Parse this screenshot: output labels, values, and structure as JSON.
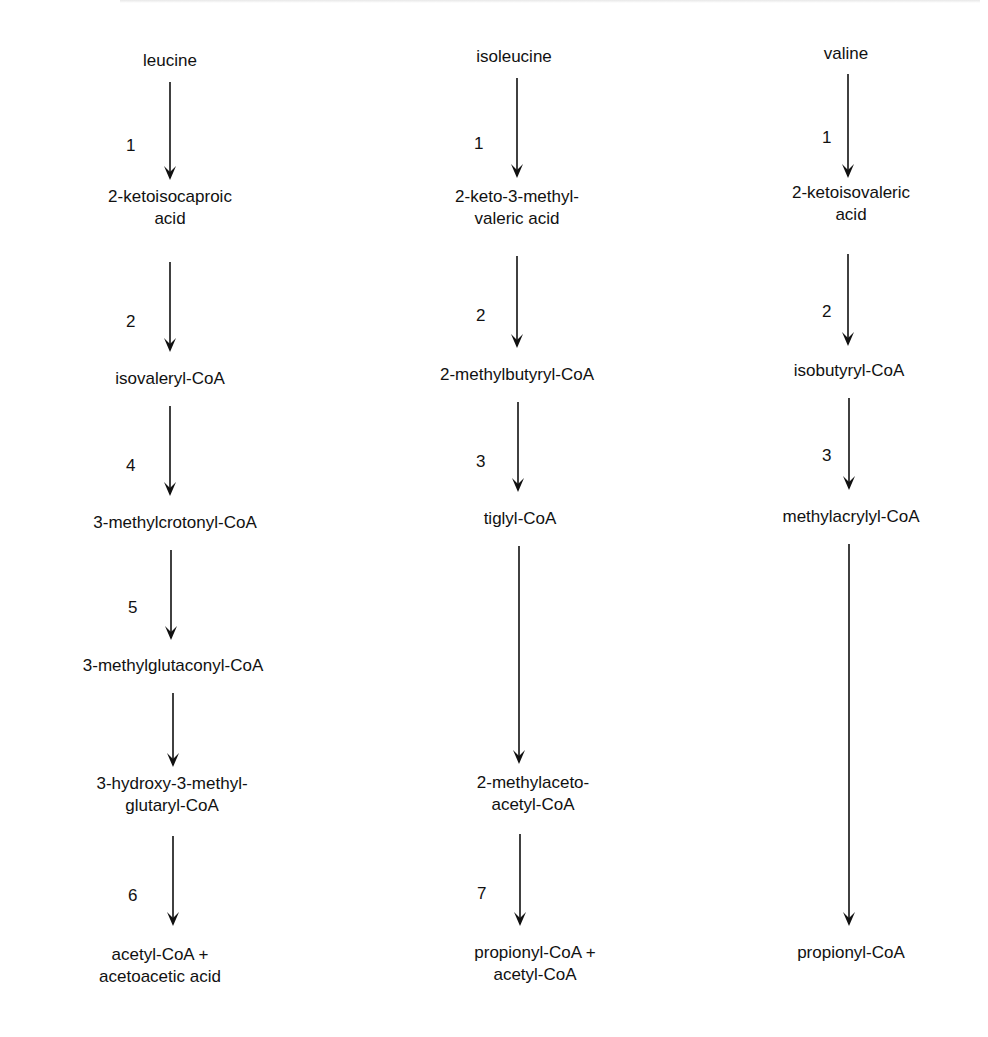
{
  "figure": {
    "type": "metabolic pathway diagram",
    "columns": [
      {
        "name": "leucine",
        "nodes": [
          {
            "lines": [
              "leucine"
            ]
          },
          {
            "lines": [
              "2-ketoisocaproic",
              "acid"
            ]
          },
          {
            "lines": [
              "isovaleryl-CoA"
            ]
          },
          {
            "lines": [
              "3-methylcrotonyl-CoA"
            ]
          },
          {
            "lines": [
              "3-methylglutaconyl-CoA"
            ]
          },
          {
            "lines": [
              "3-hydroxy-3-methyl-",
              "glutaryl-CoA"
            ]
          },
          {
            "lines": [
              "acetyl-CoA +",
              "acetoacetic acid"
            ]
          }
        ],
        "steps": [
          "1",
          "2",
          "4",
          "5",
          "",
          "6"
        ]
      },
      {
        "name": "isoleucine",
        "nodes": [
          {
            "lines": [
              "isoleucine"
            ]
          },
          {
            "lines": [
              "2-keto-3-methyl-",
              "valeric acid"
            ]
          },
          {
            "lines": [
              "2-methylbutyryl-CoA"
            ]
          },
          {
            "lines": [
              "tiglyl-CoA"
            ]
          },
          {
            "lines": [
              "2-methylaceto-",
              "acetyl-CoA"
            ]
          },
          {
            "lines": [
              "propionyl-CoA +",
              "acetyl-CoA"
            ]
          }
        ],
        "steps": [
          "1",
          "2",
          "3",
          "",
          "7"
        ]
      },
      {
        "name": "valine",
        "nodes": [
          {
            "lines": [
              "valine"
            ]
          },
          {
            "lines": [
              "2-ketoisovaleric",
              "acid"
            ]
          },
          {
            "lines": [
              "isobutyryl-CoA"
            ]
          },
          {
            "lines": [
              "methylacrylyl-CoA"
            ]
          },
          {
            "lines": [
              "propionyl-CoA"
            ]
          }
        ],
        "steps": [
          "1",
          "2",
          "3",
          ""
        ]
      }
    ]
  }
}
